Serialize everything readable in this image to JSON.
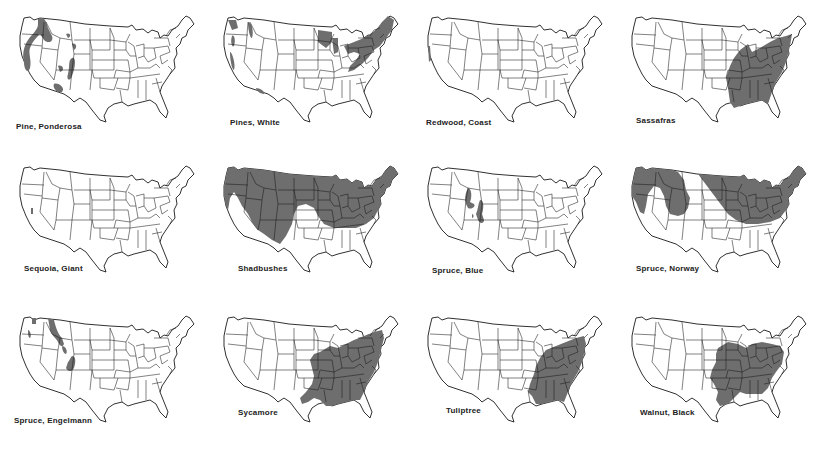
{
  "figure": {
    "title": "",
    "range_color": "#6e6e6e",
    "outline_color": "#1a1a1a",
    "background": "#ffffff"
  },
  "maps": [
    {
      "label": "Pine, Ponderosa",
      "region": "Western mountains: Pacific Northwest, Sierra Nevada, northern Rockies, Black Hills, Colorado, Arizona and New Mexico plateaus"
    },
    {
      "label": "Pines, White",
      "region": "Northeast, Great Lakes, Appalachians; western patches in Cascades, northern Rockies, Sierra Nevada, Arizona"
    },
    {
      "label": "Redwood, Coast",
      "region": "Narrow strip along northern California coast"
    },
    {
      "label": "Sassafras",
      "region": "Eastern United States from Texas/Oklahoma to Atlantic, Great Lakes south to Gulf"
    },
    {
      "label": "Sequoia, Giant",
      "region": "Small groves in western Sierra Nevada, California"
    },
    {
      "label": "Shadbushes",
      "region": "Nearly nationwide except southern Great Plains, coastal California, Florida and Gulf coast"
    },
    {
      "label": "Spruce, Blue",
      "region": "Central and southern Rocky Mountains: Utah, Colorado, Wyoming"
    },
    {
      "label": "Spruce, Norway",
      "region": "Planted widely: Pacific Northwest, northern Rockies, northern plains, Great Lakes, Northeast and Appalachians"
    },
    {
      "label": "Spruce, Engelmann",
      "region": "Cascades, northern Rockies through Idaho/Montana, Colorado Rockies"
    },
    {
      "label": "Sycamore",
      "region": "Eastern United States from central Texas to New England"
    },
    {
      "label": "Tuliptree",
      "region": "Eastern United States from Louisiana/Mississippi to southern New England"
    },
    {
      "label": "Walnut, Black",
      "region": "Central and eastern United States from Texas/Kansas to Pennsylvania"
    }
  ]
}
